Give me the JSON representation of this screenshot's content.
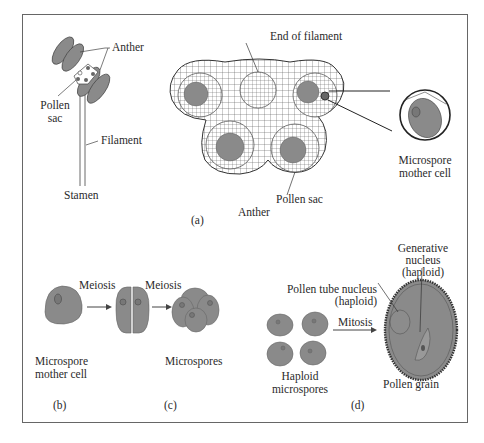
{
  "figure": {
    "panel_a": {
      "caption": "(a)",
      "stamen_labels": {
        "anther": "Anther",
        "pollen_sac_line1": "Pollen",
        "pollen_sac_line2": "sac",
        "filament": "Filament",
        "stamen": "Stamen"
      },
      "cross_section_labels": {
        "end_of_filament": "End of filament",
        "pollen_sac": "Pollen sac",
        "anther": "Anther",
        "microspore_mother_cell_line1": "Microspore",
        "microspore_mother_cell_line2": "mother cell"
      }
    },
    "panel_b": {
      "caption": "(b)",
      "cell_label_line1": "Microspore",
      "cell_label_line2": "mother cell",
      "arrow_label": "Meiosis"
    },
    "panel_c": {
      "caption": "(c)",
      "arrow_label": "Meiosis",
      "result_label": "Microspores"
    },
    "panel_d": {
      "caption": "(d)",
      "haploid_label_line1": "Haploid",
      "haploid_label_line2": "microspores",
      "arrow_label": "Mitosis",
      "tube_nucleus_line1": "Pollen tube nucleus",
      "tube_nucleus_line2": "(haploid)",
      "generative_line1": "Generative",
      "generative_line2": "nucleus",
      "generative_line3": "(haploid)",
      "pollen_grain": "Pollen grain"
    },
    "colors": {
      "cell_fill": "#8a8a8a",
      "nucleus_fill": "#6e6e6e",
      "line": "#333333",
      "frame": "#555555"
    }
  }
}
